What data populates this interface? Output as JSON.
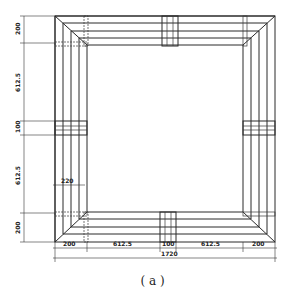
{
  "figure": {
    "caption": "( a )",
    "type": "plan view of square frame with reinforcement bars and joint connectors"
  },
  "dimensions": {
    "left": [
      {
        "id": "top-segment",
        "label": "200"
      },
      {
        "id": "upper-span",
        "label": "612.5"
      },
      {
        "id": "mid-joint",
        "label": "100"
      },
      {
        "id": "lower-span",
        "label": "612.5"
      },
      {
        "id": "bottom-segment",
        "label": "200"
      }
    ],
    "bottom": [
      {
        "id": "left-segment",
        "label": "200"
      },
      {
        "id": "left-span",
        "label": "612.5"
      },
      {
        "id": "mid-joint",
        "label": "100"
      },
      {
        "id": "right-span",
        "label": "612.5"
      },
      {
        "id": "right-segment",
        "label": "200"
      }
    ],
    "total": "1720",
    "inner_width": "220"
  },
  "colors": {
    "line": "#2a2a2a",
    "background": "#ffffff"
  }
}
